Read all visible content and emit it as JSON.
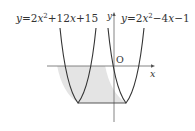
{
  "diagram": {
    "type": "function-graph",
    "curves": [
      {
        "id": "left-parabola",
        "equation": "y=2x^2+12x+15",
        "vertex": [
          -3,
          -3
        ]
      },
      {
        "id": "right-parabola",
        "equation": "y=2x^2-4x-1",
        "vertex": [
          1,
          -3
        ]
      }
    ],
    "labels": {
      "left_eq": {
        "y": "y",
        "eq": "=2",
        "x1": "x",
        "sup": "2",
        "rest": "+12",
        "x2": "x",
        "tail": "+15"
      },
      "right_eq": {
        "y": "y",
        "eq": "=2",
        "x1": "x",
        "sup": "2",
        "rest": "−4",
        "x2": "x",
        "tail": "−1"
      },
      "origin": "O",
      "x_axis": "x",
      "y_axis": "y"
    },
    "shaded_region": "between left arms of both parabolas, from y=-3 to y=0",
    "horizontal_line": "y=-3 segment between vertices",
    "colors": {
      "curve": "#3a3a3a",
      "axis": "#555555",
      "shade": "#e4e4e4"
    }
  }
}
